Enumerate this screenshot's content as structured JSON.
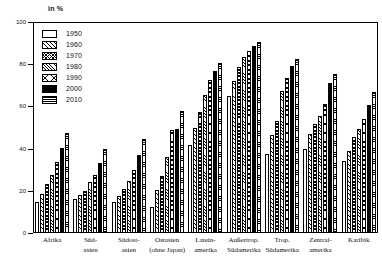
{
  "chart_data": {
    "type": "bar",
    "title": "",
    "xlabel": "",
    "ylabel": "in %",
    "ylim": [
      0,
      100
    ],
    "yticks": [
      0,
      20,
      40,
      60,
      80,
      100
    ],
    "grid": false,
    "legend_position": "top-left",
    "categories": [
      "Afrika",
      "Süd-asien",
      "Südost-asien",
      "Ostasien (ohne Japan)",
      "Latein-amerika",
      "Außertrop. Südamerika",
      "Trop. Südamerika",
      "Zentral-amerika",
      "Karibik"
    ],
    "category_lines": [
      [
        "Afrika"
      ],
      [
        "Süd-",
        "asien"
      ],
      [
        "Südost-",
        "asien"
      ],
      [
        "Ostasien",
        "(ohne Japan)"
      ],
      [
        "Latein-",
        "amerika"
      ],
      [
        "Außertrop.",
        "Südamerika"
      ],
      [
        "Trop.",
        "Südamerika"
      ],
      [
        "Zentral-",
        "amerika"
      ],
      [
        "Karibik"
      ]
    ],
    "series": [
      {
        "name": "1950",
        "pattern": "blank",
        "values": [
          14.5,
          16.0,
          14.8,
          12.5,
          41.5,
          65.0,
          37.5,
          40.0,
          34.0
        ]
      },
      {
        "name": "1960",
        "pattern": "diag-hatch",
        "values": [
          18.5,
          18.0,
          17.5,
          20.5,
          50.0,
          72.0,
          46.5,
          47.0,
          39.0
        ]
      },
      {
        "name": "1970",
        "pattern": "cross-hatch",
        "values": [
          23.0,
          20.0,
          21.0,
          27.0,
          57.5,
          78.5,
          53.0,
          51.5,
          45.5
        ]
      },
      {
        "name": "1980",
        "pattern": "fine-diag",
        "values": [
          27.5,
          24.0,
          24.5,
          36.0,
          65.5,
          83.5,
          67.5,
          55.5,
          49.5
        ]
      },
      {
        "name": "1990",
        "pattern": "x-hatch",
        "values": [
          33.5,
          27.5,
          30.0,
          49.0,
          72.5,
          86.5,
          73.5,
          61.0,
          54.0
        ]
      },
      {
        "name": "2000",
        "pattern": "solid-black",
        "values": [
          40.5,
          33.0,
          37.0,
          49.5,
          77.0,
          88.5,
          79.0,
          71.0,
          60.5
        ]
      },
      {
        "name": "2010",
        "pattern": "horiz-lines",
        "values": [
          47.5,
          40.0,
          44.5,
          58.0,
          80.5,
          90.5,
          82.5,
          75.5,
          67.0
        ]
      }
    ]
  }
}
